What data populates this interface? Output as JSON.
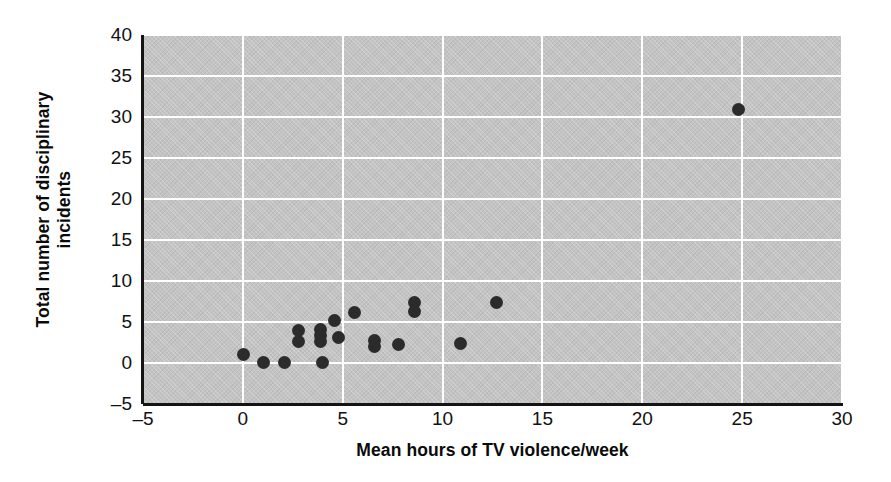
{
  "chart_data": {
    "type": "scatter",
    "title": "",
    "xlabel": "Mean hours of TV violence/week",
    "ylabel_line1": "Total number of disciplinary",
    "ylabel_line2": "incidents",
    "xlim": [
      -5,
      30
    ],
    "ylim": [
      -5,
      40
    ],
    "xticks": [
      "-5",
      "0",
      "5",
      "10",
      "15",
      "20",
      "25",
      "30"
    ],
    "xtick_values": [
      -5,
      0,
      5,
      10,
      15,
      20,
      25,
      30
    ],
    "yticks": [
      "-5",
      "0",
      "5",
      "10",
      "15",
      "20",
      "25",
      "30",
      "35",
      "40"
    ],
    "ytick_values": [
      -5,
      0,
      5,
      10,
      15,
      20,
      25,
      30,
      35,
      40
    ],
    "grid": true,
    "legend": "none",
    "plot_bg_color": "#c3c3c3",
    "gridline_color": "#ffffff",
    "point_color": "#2b2b2b",
    "axis_color": "#141414",
    "marker_size_px": 13,
    "points": [
      {
        "x": 0.05,
        "y": 1.0
      },
      {
        "x": 1.05,
        "y": 0.1
      },
      {
        "x": 2.1,
        "y": 0.1
      },
      {
        "x": 2.8,
        "y": 4.0
      },
      {
        "x": 2.8,
        "y": 2.6
      },
      {
        "x": 3.9,
        "y": 4.1
      },
      {
        "x": 3.9,
        "y": 3.3
      },
      {
        "x": 3.9,
        "y": 2.6
      },
      {
        "x": 4.0,
        "y": 0.1
      },
      {
        "x": 4.6,
        "y": 5.2
      },
      {
        "x": 4.8,
        "y": 3.1
      },
      {
        "x": 5.6,
        "y": 6.2
      },
      {
        "x": 6.6,
        "y": 2.7
      },
      {
        "x": 6.6,
        "y": 2.0
      },
      {
        "x": 7.8,
        "y": 2.2
      },
      {
        "x": 8.6,
        "y": 7.4
      },
      {
        "x": 8.6,
        "y": 6.3
      },
      {
        "x": 10.9,
        "y": 2.4
      },
      {
        "x": 12.7,
        "y": 7.4
      },
      {
        "x": 24.8,
        "y": 30.9
      }
    ]
  }
}
